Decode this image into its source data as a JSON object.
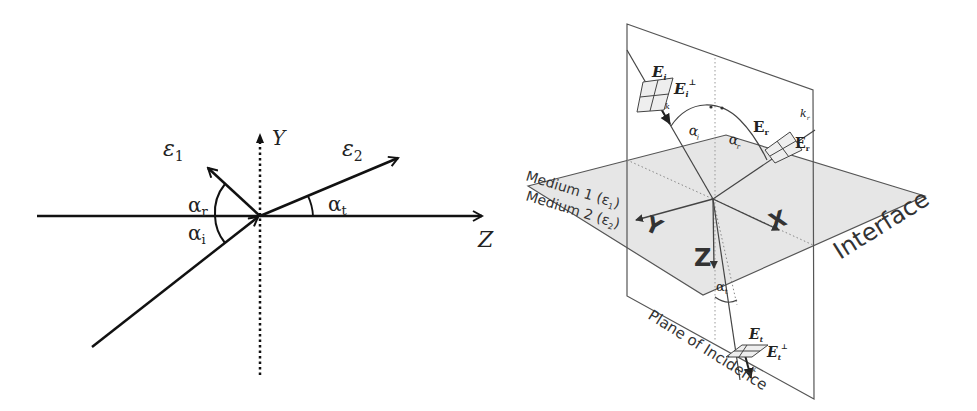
{
  "left_diagram": {
    "axes": {
      "y_label": "Y",
      "z_label": "Z"
    },
    "media": {
      "medium1": "ε",
      "medium1_sub": "1",
      "medium2": "ε",
      "medium2_sub": "2"
    },
    "angles": {
      "reflected": "α",
      "reflected_sub": "r",
      "incident": "α",
      "incident_sub": "i",
      "transmitted": "α",
      "transmitted_sub": "t"
    }
  },
  "right_diagram": {
    "axes": {
      "x_label": "X",
      "y_label": "Y",
      "z_label": "Z"
    },
    "medium1_label": "Medium 1 (ε",
    "medium1_sub": "1",
    "medium2_label": "Medium 2 (ε",
    "medium2_sub": "2",
    "close_paren": ")",
    "interface_label": "Interface",
    "plane_label": "Plane of Incidence",
    "incident_field": {
      "parallel": "E",
      "parallel_sub": "i",
      "parallel_sup": "∥",
      "perp": "E",
      "perp_sub": "i",
      "perp_sup": "⊥",
      "wave_vector": "k",
      "wave_vector_sub": "i"
    },
    "reflected_field": {
      "parallel": "E",
      "parallel_sub": "r",
      "parallel_sup": "∥",
      "perp": "E",
      "perp_sub": "r",
      "perp_sup": "⊥",
      "wave_vector": "k",
      "wave_vector_sub": "r"
    },
    "transmitted_field": {
      "parallel": "E",
      "parallel_sub": "t",
      "parallel_sup": "∥",
      "perp": "E",
      "perp_sub": "t",
      "perp_sup": "⊥",
      "wave_vector": "k",
      "wave_vector_sub": "t"
    },
    "angles": {
      "incident": "α",
      "incident_sub": "i",
      "reflected": "α",
      "reflected_sub": "r",
      "transmitted": "α",
      "transmitted_sub": "t"
    }
  }
}
